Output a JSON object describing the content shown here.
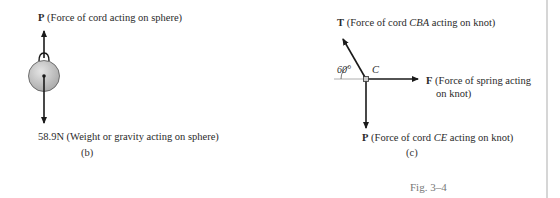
{
  "figure_b": {
    "top_force": {
      "symbol": "P",
      "description": "(Force of cord acting on sphere)"
    },
    "bottom_force": {
      "value": "58.9N",
      "description": "(Weight or gravity acting on sphere)"
    },
    "caption": "(b)"
  },
  "figure_c": {
    "knot_label": "C",
    "angle_label": "60°",
    "T_force": {
      "symbol": "T",
      "desc_pre": "(Force of cord ",
      "desc_italic": "CBA",
      "desc_post": " acting on knot)"
    },
    "F_force": {
      "symbol": "F",
      "desc_line1": "(Force of spring acting",
      "desc_line2": "on knot)"
    },
    "P_force": {
      "symbol": "P",
      "desc_pre": "(Force of cord ",
      "desc_italic": "CE",
      "desc_post": " acting on knot)"
    },
    "caption": "(c)",
    "angle_degrees": 60
  },
  "figure_caption": "Fig. 3–4",
  "colors": {
    "sphere_fill": "#bdbdbd",
    "line": "#1a1a1a",
    "divider": "#d6d6d6"
  }
}
